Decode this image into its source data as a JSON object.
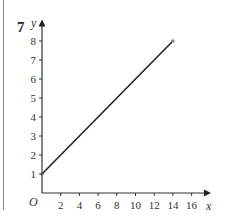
{
  "question_number": "7",
  "chart_data": {
    "type": "line",
    "title": "",
    "xlabel": "x",
    "ylabel": "y",
    "origin_label": "O",
    "x_ticks": [
      2,
      4,
      6,
      8,
      10,
      12,
      14,
      16
    ],
    "y_ticks": [
      1,
      2,
      3,
      4,
      5,
      6,
      7,
      8
    ],
    "xlim": [
      0,
      17
    ],
    "ylim": [
      0,
      8.6
    ],
    "grid": false,
    "series": [
      {
        "name": "line",
        "x": [
          0,
          14
        ],
        "y": [
          1,
          8
        ],
        "color": "#222222"
      }
    ],
    "endpoint_marker": {
      "x": 14,
      "y": 8,
      "color": "#888888"
    }
  }
}
